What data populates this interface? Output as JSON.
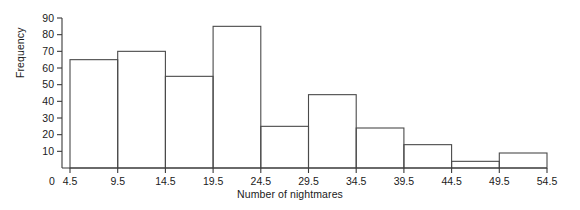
{
  "chart_data": {
    "type": "bar",
    "title": "",
    "xlabel": "Number of nightmares",
    "ylabel": "Frequency",
    "bin_edges": [
      4.5,
      9.5,
      14.5,
      19.5,
      24.5,
      29.5,
      34.5,
      39.5,
      44.5,
      49.5,
      54.5
    ],
    "categories": [
      "4.5-9.5",
      "9.5-14.5",
      "14.5-19.5",
      "19.5-24.5",
      "24.5-29.5",
      "29.5-34.5",
      "34.5-39.5",
      "39.5-44.5",
      "44.5-49.5",
      "49.5-54.5"
    ],
    "values": [
      65,
      70,
      55,
      85,
      25,
      44,
      24,
      14,
      4,
      9
    ],
    "xticks": [
      "0",
      "4.5",
      "9.5",
      "14.5",
      "19.5",
      "24.5",
      "29.5",
      "34.5",
      "39.5",
      "44.5",
      "49.5",
      "54.5"
    ],
    "yticks": [
      "10",
      "20",
      "30",
      "40",
      "50",
      "60",
      "70",
      "80",
      "90"
    ],
    "ylim": [
      0,
      90
    ],
    "xlim": [
      4.5,
      54.5
    ],
    "grid": false,
    "legend": false,
    "bar_fill": "#ffffff",
    "bar_stroke": "#4a4a4a",
    "axis_color": "#3a3a3a",
    "background": "#ffffff"
  }
}
